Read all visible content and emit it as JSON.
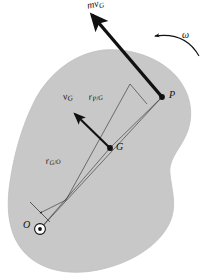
{
  "figure": {
    "kind": "rigid-body-momentum-diagram",
    "background_color": "#ffffff",
    "body": {
      "name": "rigid-body",
      "fill_color": "#c8c8c8",
      "stroke_color": "#b4b4b4"
    },
    "labels": {
      "momentum_vector": {
        "symbol": "mv",
        "subscript": "G"
      },
      "angular_velocity": {
        "symbol": "ω",
        "subscript": ""
      },
      "point_p": {
        "symbol": "P",
        "subscript": ""
      },
      "velocity_g": {
        "symbol": "v",
        "subscript": "G"
      },
      "r_p_over_g": {
        "symbol": "r",
        "subscript": "P/G"
      },
      "point_g": {
        "symbol": "G",
        "subscript": ""
      },
      "r_g_over_o": {
        "symbol": "r",
        "subscript": "G/O"
      },
      "point_o": {
        "symbol": "O",
        "subscript": ""
      }
    },
    "points": {
      "P": {
        "x": 162,
        "y": 97,
        "marker": "filled-dot"
      },
      "G": {
        "x": 110,
        "y": 148,
        "marker": "filled-dot"
      },
      "O": {
        "x": 40,
        "y": 229,
        "marker": "circled-dot"
      }
    },
    "vectors": {
      "momentum_at_p": {
        "from_x": 162,
        "from_y": 97,
        "to_x": 89,
        "to_y": 12,
        "style": "thick",
        "color": "#111111"
      },
      "velocity_at_g": {
        "from_x": 110,
        "from_y": 148,
        "to_x": 73,
        "to_y": 112,
        "style": "medium",
        "color": "#111111"
      },
      "angular_velocity_arc": {
        "start_x": 196,
        "start_y": 53,
        "end_x": 150,
        "end_y": 40,
        "style": "curved",
        "color": "#111111",
        "direction": "counterclockwise"
      }
    },
    "construction_lines": {
      "r_g_over_o_line": {
        "from_x": 40,
        "from_y": 229,
        "to_x": 110,
        "to_y": 148
      },
      "o_to_p_line": {
        "from_x": 40,
        "from_y": 229,
        "to_x": 162,
        "to_y": 97
      },
      "r_p_over_g_line": {
        "from_x": 110,
        "from_y": 148,
        "to_x": 162,
        "to_y": 97
      },
      "parallel_offset_line": {
        "from_x": 66,
        "from_y": 200,
        "to_x": 130,
        "to_y": 84
      },
      "tick_near_o": {
        "from_x": 30,
        "from_y": 205,
        "to_x": 48,
        "to_y": 220
      },
      "tick_near_p": {
        "from_x": 130,
        "from_y": 84,
        "to_x": 146,
        "to_y": 104
      }
    }
  }
}
